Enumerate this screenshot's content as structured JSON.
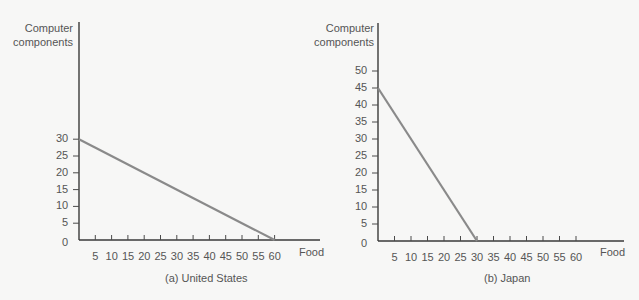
{
  "chart_data": [
    {
      "type": "line",
      "title": "(a) United States",
      "xlabel": "Food",
      "ylabel": "Computer components",
      "xlim": [
        0,
        60
      ],
      "ylim": [
        0,
        30
      ],
      "x_ticks": [
        5,
        10,
        15,
        20,
        25,
        30,
        35,
        40,
        45,
        50,
        55,
        60
      ],
      "y_ticks": [
        0,
        5,
        10,
        15,
        20,
        25,
        30
      ],
      "grid": false,
      "series": [
        {
          "name": "Production possibilities frontier",
          "x": [
            0,
            60
          ],
          "y": [
            30,
            0
          ]
        }
      ]
    },
    {
      "type": "line",
      "title": "(b) Japan",
      "xlabel": "Food",
      "ylabel": "Computer components",
      "xlim": [
        0,
        60
      ],
      "ylim": [
        0,
        50
      ],
      "x_ticks": [
        5,
        10,
        15,
        20,
        25,
        30,
        35,
        40,
        45,
        50,
        55,
        60
      ],
      "y_ticks": [
        0,
        5,
        10,
        15,
        20,
        25,
        30,
        35,
        40,
        45,
        50
      ],
      "grid": false,
      "series": [
        {
          "name": "Production possibilities frontier",
          "x": [
            0,
            30
          ],
          "y": [
            45,
            0
          ]
        }
      ]
    }
  ],
  "charts": {
    "a": {
      "ylabel_line1": "Computer",
      "ylabel_line2": "components",
      "xlabel": "Food",
      "caption": "(a) United States",
      "origin": "0"
    },
    "b": {
      "ylabel_line1": "Computer",
      "ylabel_line2": "components",
      "xlabel": "Food",
      "caption": "(b) Japan",
      "origin": "0"
    }
  }
}
